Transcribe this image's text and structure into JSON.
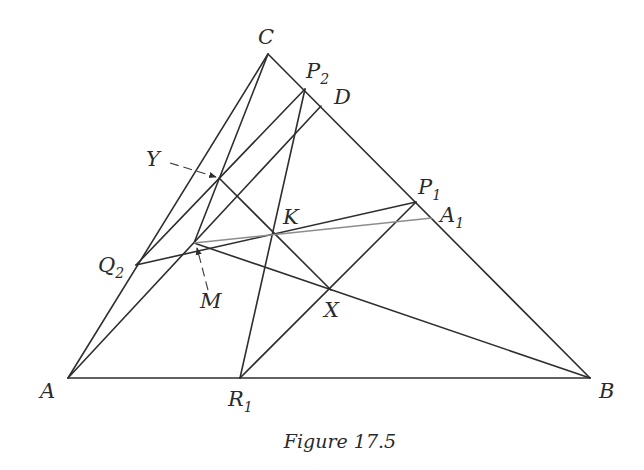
{
  "figure": {
    "caption": "Figure 17.5",
    "points": {
      "A": {
        "label": "A",
        "x": 68,
        "y": 378
      },
      "B": {
        "label": "B",
        "x": 590,
        "y": 378
      },
      "C": {
        "label": "C",
        "x": 268,
        "y": 54
      },
      "D": {
        "label": "D",
        "x": 321,
        "y": 106
      },
      "P1": {
        "label": "P",
        "sub": "1",
        "x": 416,
        "y": 202
      },
      "P2": {
        "label": "P",
        "sub": "2",
        "x": 305,
        "y": 89
      },
      "A1": {
        "label": "A",
        "sub": "1",
        "x": 432,
        "y": 218
      },
      "Q2": {
        "label": "Q",
        "sub": "2",
        "x": 136,
        "y": 265
      },
      "R1": {
        "label": "R",
        "sub": "1",
        "x": 240,
        "y": 378
      },
      "K": {
        "label": "K",
        "x": 275,
        "y": 235
      },
      "X": {
        "label": "X",
        "x": 331,
        "y": 290
      },
      "Y": {
        "label": "Y",
        "x": 219,
        "y": 178
      },
      "M": {
        "label": "M",
        "x": 194,
        "y": 243
      }
    },
    "segments": [
      [
        "A",
        "B"
      ],
      [
        "B",
        "C"
      ],
      [
        "C",
        "A"
      ],
      [
        "C",
        "M"
      ],
      [
        "P2",
        "Q2"
      ],
      [
        "P2",
        "R1"
      ],
      [
        "D",
        "A"
      ],
      [
        "Q2",
        "P1"
      ],
      [
        "M",
        "B"
      ],
      [
        "Y",
        "X"
      ],
      [
        "R1",
        "P1"
      ]
    ],
    "gray_segments": [
      [
        "M",
        "A1"
      ]
    ],
    "callouts": [
      {
        "label": "Y",
        "target": "Y"
      },
      {
        "label": "M",
        "target": "M"
      }
    ]
  }
}
